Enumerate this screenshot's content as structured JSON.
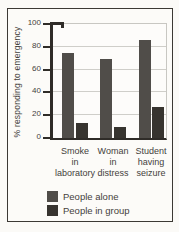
{
  "figure": {
    "background": "#fcfbf8",
    "border_color": "#3c3934"
  },
  "chart_data": {
    "type": "bar",
    "title": "",
    "categories": [
      "Smoke\nin\nlaboratory",
      "Woman\nin\ndistress",
      "Student\nhaving\nseizure"
    ],
    "series": [
      {
        "name": "People alone",
        "values": [
          75,
          69,
          86
        ],
        "color": "#504d49"
      },
      {
        "name": "People in group",
        "values": [
          13,
          10,
          27
        ],
        "color": "#37342f"
      }
    ],
    "xlabel": "",
    "ylabel": "% responding to emergency",
    "ylim": [
      0,
      100
    ],
    "y_ticks": [
      0,
      20,
      40,
      60,
      80,
      100
    ],
    "grid": "horizontal",
    "legend_position": "bottom",
    "axis_color": "#2f2c28",
    "grid_color": "#cfcec9",
    "text_color": "#44413c"
  }
}
